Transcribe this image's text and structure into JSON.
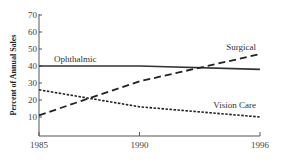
{
  "chart_data": {
    "type": "line",
    "title": "",
    "xlabel": "",
    "ylabel": "Percent of Annual Sales",
    "x": [
      1985,
      1990,
      1996
    ],
    "x_tick_labels": [
      "1985",
      "1990",
      "1996"
    ],
    "y_ticks": [
      10,
      20,
      30,
      40,
      50,
      60,
      70
    ],
    "y_tick_labels": [
      "10",
      "20",
      "30",
      "40",
      "50",
      "60",
      "70"
    ],
    "ylim": [
      0,
      70
    ],
    "xlim": [
      1985,
      1996
    ],
    "grid": false,
    "legend": "inline labels",
    "series": [
      {
        "name": "Ophthalmic",
        "values": [
          40,
          40,
          38
        ],
        "style": "solid",
        "color": "#333333"
      },
      {
        "name": "Surgical",
        "values": [
          11,
          31,
          47
        ],
        "style": "long-dash",
        "color": "#222222"
      },
      {
        "name": "Vision Care",
        "values": [
          26,
          16,
          10
        ],
        "style": "short-dash",
        "color": "#222222"
      }
    ]
  }
}
